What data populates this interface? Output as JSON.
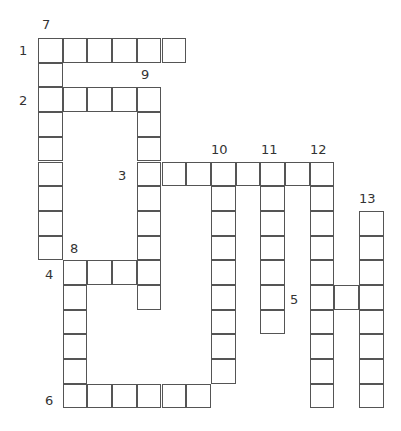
{
  "puzzle": {
    "grid": {
      "origin_x": 38,
      "origin_y": 38,
      "cell_size": 24.7
    },
    "entries": [
      {
        "number": "1",
        "direction": "across",
        "row": 0,
        "col": 0,
        "length": 6
      },
      {
        "number": "2",
        "direction": "across",
        "row": 2,
        "col": 0,
        "length": 5
      },
      {
        "number": "3",
        "direction": "across",
        "row": 5,
        "col": 4,
        "length": 8
      },
      {
        "number": "4",
        "direction": "across",
        "row": 9,
        "col": 1,
        "length": 4
      },
      {
        "number": "5",
        "direction": "across",
        "row": 10,
        "col": 11,
        "length": 3
      },
      {
        "number": "6",
        "direction": "across",
        "row": 14,
        "col": 1,
        "length": 6
      },
      {
        "number": "7",
        "direction": "down",
        "row": 0,
        "col": 0,
        "length": 9
      },
      {
        "number": "8",
        "direction": "down",
        "row": 9,
        "col": 1,
        "length": 6
      },
      {
        "number": "9",
        "direction": "down",
        "row": 2,
        "col": 4,
        "length": 9
      },
      {
        "number": "10",
        "direction": "down",
        "row": 5,
        "col": 7,
        "length": 9
      },
      {
        "number": "11",
        "direction": "down",
        "row": 5,
        "col": 9,
        "length": 7
      },
      {
        "number": "12",
        "direction": "down",
        "row": 5,
        "col": 11,
        "length": 10
      },
      {
        "number": "13",
        "direction": "down",
        "row": 7,
        "col": 13,
        "length": 8
      }
    ],
    "labels": [
      {
        "text": "7",
        "x": 42,
        "y": 18
      },
      {
        "text": "1",
        "x": 19,
        "y": 44
      },
      {
        "text": "9",
        "x": 141,
        "y": 68
      },
      {
        "text": "2",
        "x": 19,
        "y": 94
      },
      {
        "text": "10",
        "x": 211,
        "y": 143
      },
      {
        "text": "11",
        "x": 261,
        "y": 143
      },
      {
        "text": "12",
        "x": 310,
        "y": 143
      },
      {
        "text": "3",
        "x": 118,
        "y": 169
      },
      {
        "text": "13",
        "x": 359,
        "y": 192
      },
      {
        "text": "8",
        "x": 70,
        "y": 242
      },
      {
        "text": "4",
        "x": 45,
        "y": 268
      },
      {
        "text": "5",
        "x": 290,
        "y": 293
      },
      {
        "text": "6",
        "x": 45,
        "y": 394
      }
    ]
  }
}
